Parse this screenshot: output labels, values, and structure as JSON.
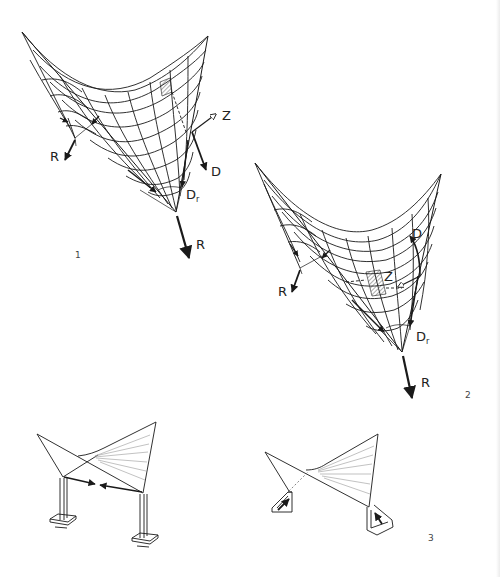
{
  "diagram": {
    "colors": {
      "line": "#1a1a1a",
      "thin_line": "#555555",
      "background": "#ffffff",
      "light_line": "#999999"
    },
    "figures": [
      {
        "number": "1",
        "description": "Hypar shell with edge members; tension Z and compression D forces resolved at bottom support",
        "labels": {
          "reaction_left": "R",
          "tension": "Z",
          "compression": "D",
          "compression_resultant": "D",
          "compression_resultant_sub": "r",
          "reaction_bottom": "R"
        }
      },
      {
        "number": "2",
        "description": "Hypar shell with alternate force path; Z and D arrows within surface",
        "labels": {
          "reaction_left": "R",
          "tension": "Z",
          "compression": "D",
          "compression_resultant": "D",
          "compression_resultant_sub": "r",
          "reaction_bottom": "R"
        }
      },
      {
        "number": "3",
        "description": "Two support variants: columns with tie member (left) and inclined abutments (right)",
        "labels": {}
      }
    ]
  }
}
